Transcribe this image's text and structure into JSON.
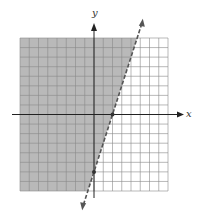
{
  "chart_data": {
    "type": "inequality-graph",
    "title": "",
    "xlabel": "x",
    "ylabel": "y",
    "xlim": [
      -8,
      8
    ],
    "ylim": [
      -8,
      8
    ],
    "grid": true,
    "grid_step": 1,
    "boundary_line": {
      "equation": "y = 3x - 6",
      "slope": 3,
      "intercept": -6,
      "style": "dashed",
      "marked_points": [
        [
          2,
          0
        ],
        [
          0,
          -6
        ]
      ]
    },
    "inequality": "y > 3x - 6",
    "shaded_region": "left/above the line",
    "colors": {
      "shade": "#b9b9b9",
      "grid": "#8a8a8a",
      "line": "#555555",
      "axis": "#222222"
    }
  },
  "labels": {
    "x": "x",
    "y": "y"
  }
}
